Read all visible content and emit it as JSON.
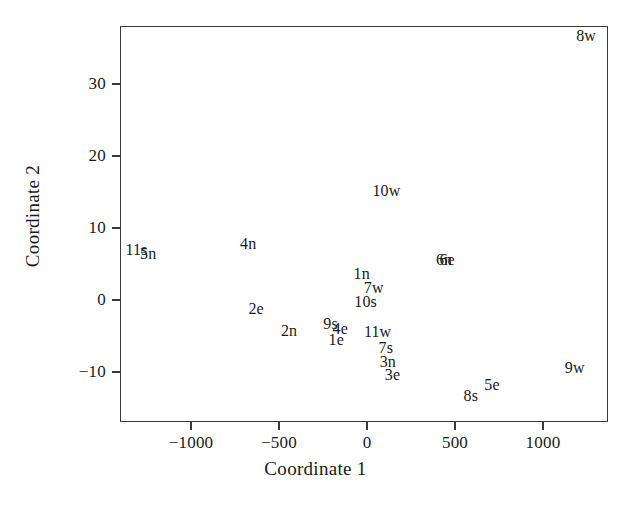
{
  "chart_data": {
    "type": "scatter",
    "title": "",
    "xlabel": "Coordinate 1",
    "ylabel": "Coordinate 2",
    "xlim": [
      -1382,
      1391
    ],
    "ylim": [
      -15.2,
      37.9
    ],
    "xticks": [
      -1000,
      -500,
      0,
      500,
      1000
    ],
    "xticklabels": [
      "−1000",
      "−500",
      "0",
      "500",
      "1000"
    ],
    "yticks": [
      30,
      20,
      10,
      0,
      -10
    ],
    "yticklabels": [
      "30",
      "20",
      "10",
      "0",
      "−10"
    ],
    "grid": false,
    "legend": false,
    "marker_style": "text-label-only",
    "points": [
      {
        "label": "8w",
        "x": 1245,
        "y": 36.6
      },
      {
        "label": "10w",
        "x": 110,
        "y": 15.2
      },
      {
        "label": "11s",
        "x": -1310,
        "y": 7.0
      },
      {
        "label": "5n",
        "x": -1243,
        "y": 6.4
      },
      {
        "label": "4n",
        "x": -675,
        "y": 7.8
      },
      {
        "label": "6n",
        "x": 438,
        "y": 5.6
      },
      {
        "label": "6e",
        "x": 455,
        "y": 5.5
      },
      {
        "label": "1n",
        "x": -30,
        "y": 3.6
      },
      {
        "label": "7w",
        "x": 38,
        "y": 1.7
      },
      {
        "label": "10s",
        "x": -8,
        "y": -0.3
      },
      {
        "label": "2e",
        "x": -630,
        "y": -1.2
      },
      {
        "label": "9s",
        "x": -207,
        "y": -3.4
      },
      {
        "label": "4e",
        "x": -152,
        "y": -4.0
      },
      {
        "label": "2n",
        "x": -443,
        "y": -4.3
      },
      {
        "label": "11w",
        "x": 60,
        "y": -4.5
      },
      {
        "label": "1e",
        "x": -175,
        "y": -5.6
      },
      {
        "label": "7s",
        "x": 107,
        "y": -6.7
      },
      {
        "label": "3n",
        "x": 118,
        "y": -8.6
      },
      {
        "label": "9w",
        "x": 1180,
        "y": -9.4
      },
      {
        "label": "3e",
        "x": 145,
        "y": -10.4
      },
      {
        "label": "5e",
        "x": 710,
        "y": -11.8
      },
      {
        "label": "8s",
        "x": 590,
        "y": -13.4
      }
    ]
  },
  "colors": {
    "axis": "#3a3a3a",
    "text": "#1a1a1a",
    "background": "#ffffff"
  }
}
